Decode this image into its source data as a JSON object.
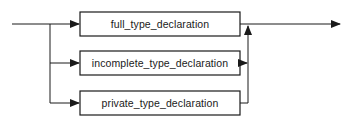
{
  "diagram": {
    "type": "syntax-railroad",
    "line_color": "#1a1a1a",
    "box_fill": "#ffffff",
    "boxes": [
      {
        "label": "full_type_declaration"
      },
      {
        "label": "incomplete_type_declaration"
      },
      {
        "label": "private_type_declaration"
      }
    ],
    "icons": {
      "entry_arrow": "arrow-right-icon",
      "merge_arrow": "arrow-up-icon",
      "exit_arrow": "arrow-right-icon"
    }
  }
}
